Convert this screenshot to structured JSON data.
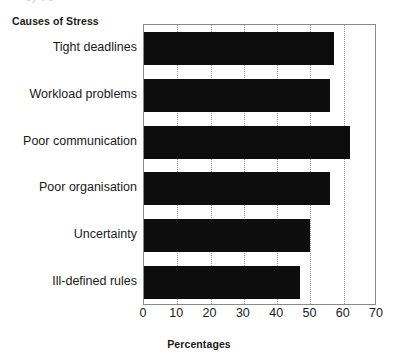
{
  "page": {
    "top_sliver_text": "sy  t  e"
  },
  "chart_data": {
    "type": "bar",
    "orientation": "horizontal",
    "title": "Causes of Stress",
    "subtitle": "",
    "xlabel": "Percentages",
    "ylabel": "",
    "categories": [
      "Tight deadlines",
      "Workload problems",
      "Poor communication",
      "Poor organisation",
      "Uncertainty",
      "Ill-defined rules"
    ],
    "values": [
      57,
      56,
      62,
      56,
      50,
      47
    ],
    "xlim": [
      0,
      70
    ],
    "xticks": [
      0,
      10,
      20,
      30,
      40,
      50,
      60,
      70
    ],
    "xtick_labels": [
      "0",
      "10",
      "20",
      "30",
      "40",
      "50",
      "60",
      "70"
    ],
    "grid": "vertical-dotted",
    "legend": "none",
    "bar_color": "#0d0d0d",
    "gridline_color": "#9a9a9a",
    "frame_color": "#8a8a8a"
  }
}
